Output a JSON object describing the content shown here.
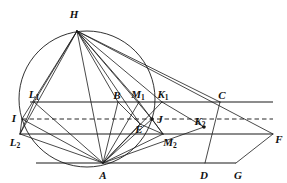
{
  "figure": {
    "kind": "geometric-construction-diagram",
    "width": 287,
    "height": 183,
    "background_color": "#ffffff",
    "stroke_color": "#1a1a1a",
    "dash_color": "#111111"
  },
  "points": [
    {
      "id": "H",
      "label": "H",
      "sub": "",
      "x": 77,
      "y": 31,
      "label_x": 74,
      "label_y": 14,
      "marked": false
    },
    {
      "id": "L1",
      "label": "L",
      "sub": "1",
      "x": 34,
      "y": 102,
      "label_x": 34,
      "label_y": 95,
      "marked": false
    },
    {
      "id": "I",
      "label": "I",
      "sub": "",
      "x": 22,
      "y": 119,
      "label_x": 14,
      "label_y": 118,
      "marked": false
    },
    {
      "id": "L2",
      "label": "L",
      "sub": "2",
      "x": 20,
      "y": 134,
      "label_x": 15,
      "label_y": 143,
      "marked": false
    },
    {
      "id": "B",
      "label": "B",
      "sub": "",
      "x": 118,
      "y": 102,
      "label_x": 117,
      "label_y": 95,
      "marked": false
    },
    {
      "id": "M1",
      "label": "M",
      "sub": "1",
      "x": 139,
      "y": 102,
      "label_x": 138,
      "label_y": 95,
      "marked": false
    },
    {
      "id": "K1",
      "label": "K",
      "sub": "1",
      "x": 162,
      "y": 102,
      "label_x": 163,
      "label_y": 95,
      "marked": false
    },
    {
      "id": "C",
      "label": "C",
      "sub": "",
      "x": 220,
      "y": 102,
      "label_x": 222,
      "label_y": 95,
      "marked": false
    },
    {
      "id": "E",
      "label": "E",
      "sub": "",
      "x": 140,
      "y": 124,
      "label_x": 139,
      "label_y": 129,
      "marked": false
    },
    {
      "id": "J",
      "label": "J",
      "sub": "",
      "x": 152,
      "y": 119,
      "label_x": 160,
      "label_y": 119,
      "marked": true
    },
    {
      "id": "K2",
      "label": "K",
      "sub": "2",
      "x": 204,
      "y": 127,
      "label_x": 200,
      "label_y": 122,
      "marked": true
    },
    {
      "id": "M2",
      "label": "M",
      "sub": "2",
      "x": 163,
      "y": 134,
      "label_x": 170,
      "label_y": 143,
      "marked": false
    },
    {
      "id": "F",
      "label": "F",
      "sub": "",
      "x": 273,
      "y": 134,
      "label_x": 279,
      "label_y": 139,
      "marked": false
    },
    {
      "id": "A",
      "label": "A",
      "sub": "",
      "x": 103,
      "y": 163,
      "label_x": 103,
      "label_y": 175,
      "marked": false
    },
    {
      "id": "D",
      "label": "D",
      "sub": "",
      "x": 205,
      "y": 163,
      "label_x": 204,
      "label_y": 175,
      "marked": false
    },
    {
      "id": "G",
      "label": "G",
      "sub": "",
      "x": 236,
      "y": 163,
      "label_x": 238,
      "label_y": 175,
      "marked": false
    }
  ],
  "circle": {
    "center_x": 87,
    "center_y": 99,
    "radius": 68,
    "description": "circumscribed circle through H and A"
  },
  "horizontal_lines": [
    {
      "name": "upper-parallel",
      "from_x": 30,
      "from_y": 102,
      "to_x": 273,
      "to_y": 102,
      "style": "solid"
    },
    {
      "name": "mid-parallel",
      "from_x": 22,
      "from_y": 119,
      "to_x": 273,
      "to_y": 119,
      "style": "dashed"
    },
    {
      "name": "lower-parallel",
      "from_x": 20,
      "from_y": 134,
      "to_x": 273,
      "to_y": 134,
      "style": "solid"
    },
    {
      "name": "base-line",
      "from_x": 36,
      "from_y": 163,
      "to_x": 236,
      "to_y": 163,
      "style": "solid"
    }
  ],
  "segments": [
    {
      "name": "H-A",
      "from": "H",
      "to": "A"
    },
    {
      "name": "H-L1",
      "from": "H",
      "to": "L1"
    },
    {
      "name": "H-I",
      "from": "H",
      "to": "I"
    },
    {
      "name": "H-L2",
      "from": "H",
      "to": "L2"
    },
    {
      "name": "H-B",
      "from": "H",
      "to": "B"
    },
    {
      "name": "H-M1",
      "from": "H",
      "to": "M1"
    },
    {
      "name": "H-E",
      "from": "H",
      "to": "E"
    },
    {
      "name": "H-K1",
      "from": "H",
      "to": "K1"
    },
    {
      "name": "H-J",
      "from": "H",
      "to": "J"
    },
    {
      "name": "H-C",
      "from": "H",
      "to": "C"
    },
    {
      "name": "H-F",
      "from": "H",
      "to": "F"
    },
    {
      "name": "A-L1",
      "from": "A",
      "to": "L1"
    },
    {
      "name": "A-I",
      "from": "A",
      "to": "I"
    },
    {
      "name": "A-L2",
      "from": "A",
      "to": "L2"
    },
    {
      "name": "A-B",
      "from": "A",
      "to": "B"
    },
    {
      "name": "A-M1",
      "from": "A",
      "to": "M1"
    },
    {
      "name": "A-E",
      "from": "A",
      "to": "E"
    },
    {
      "name": "A-K1",
      "from": "A",
      "to": "K1"
    },
    {
      "name": "A-J",
      "from": "A",
      "to": "J"
    },
    {
      "name": "A-M2",
      "from": "A",
      "to": "M2"
    },
    {
      "name": "A-K2",
      "from": "A",
      "to": "K2"
    },
    {
      "name": "C-D",
      "from": "C",
      "to": "D"
    },
    {
      "name": "G-F",
      "from": "G",
      "to": "F"
    },
    {
      "name": "L1-L2",
      "from": "L1",
      "to": "L2"
    },
    {
      "name": "I-L2",
      "from": "I",
      "to": "L2"
    },
    {
      "name": "B-E",
      "from": "B",
      "to": "E"
    },
    {
      "name": "M1-M2",
      "from": "M1",
      "to": "M2"
    },
    {
      "name": "K1-K2",
      "from": "K1",
      "to": "K2"
    },
    {
      "name": "E-M2",
      "from": "E",
      "to": "M2"
    },
    {
      "name": "J-M2",
      "from": "J",
      "to": "M2"
    }
  ]
}
